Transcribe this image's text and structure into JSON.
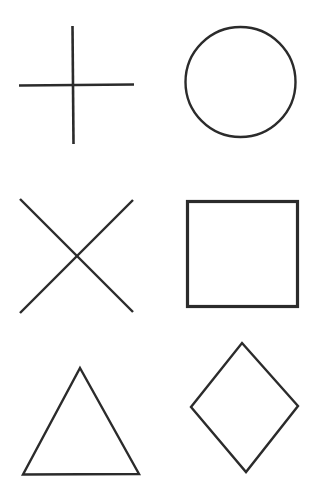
{
  "canvas": {
    "width": 319,
    "height": 499,
    "background_color": "#ffffff",
    "title": "Hand-drawn geometric shapes sheet"
  },
  "style": {
    "ink_color": "#2b2b2b",
    "stroke_width": 2.2,
    "stroke_width_thick": 3.0
  },
  "grid": {
    "columns": 2,
    "rows": 3,
    "column_labels": [
      "left",
      "right"
    ],
    "row_labels": [
      "top",
      "middle",
      "bottom"
    ]
  },
  "shapes": [
    {
      "id": "plus",
      "name": "plus-sign",
      "label": "Plus / cross",
      "row": "top",
      "column": "left",
      "kind": "lines",
      "stroke_width": 2.6,
      "segments": [
        {
          "x1": 19,
          "y1": 85.5,
          "x2": 134,
          "y2": 84.5
        },
        {
          "x1": 72.5,
          "y1": 26,
          "x2": 73.5,
          "y2": 144
        }
      ],
      "bbox": {
        "x": 19,
        "y": 26,
        "width": 115,
        "height": 118
      }
    },
    {
      "id": "circle",
      "name": "circle",
      "label": "Circle",
      "row": "top",
      "column": "right",
      "kind": "ellipse",
      "stroke_width": 2.4,
      "center": {
        "cx": 240.5,
        "cy": 82
      },
      "radius": {
        "rx": 55,
        "ry": 55
      },
      "bbox": {
        "x": 185.5,
        "y": 27,
        "width": 110,
        "height": 110
      }
    },
    {
      "id": "cross-x",
      "name": "x-cross",
      "label": "X / diagonal cross",
      "row": "middle",
      "column": "left",
      "kind": "lines",
      "stroke_width": 2.4,
      "segments": [
        {
          "x1": 20,
          "y1": 199,
          "x2": 133,
          "y2": 312
        },
        {
          "x1": 133,
          "y1": 200,
          "x2": 20,
          "y2": 313
        }
      ],
      "bbox": {
        "x": 20,
        "y": 199,
        "width": 113,
        "height": 114
      }
    },
    {
      "id": "square",
      "name": "square",
      "label": "Square",
      "row": "middle",
      "column": "right",
      "kind": "rect",
      "stroke_width": 3.2,
      "rect": {
        "x": 187.5,
        "y": 201.5,
        "width": 110,
        "height": 105
      },
      "bbox": {
        "x": 186,
        "y": 200,
        "width": 113,
        "height": 108
      }
    },
    {
      "id": "triangle",
      "name": "triangle",
      "label": "Triangle",
      "row": "bottom",
      "column": "left",
      "kind": "polygon",
      "stroke_width": 2.4,
      "points": "80,368 139,474 23,474.5",
      "bbox": {
        "x": 23,
        "y": 368,
        "width": 116,
        "height": 107
      }
    },
    {
      "id": "diamond",
      "name": "diamond",
      "label": "Diamond / rotated square",
      "row": "bottom",
      "column": "right",
      "kind": "polygon",
      "stroke_width": 2.4,
      "points": "242,343 298,406 246,472 191,407",
      "bbox": {
        "x": 191,
        "y": 343,
        "width": 107,
        "height": 129
      }
    }
  ]
}
